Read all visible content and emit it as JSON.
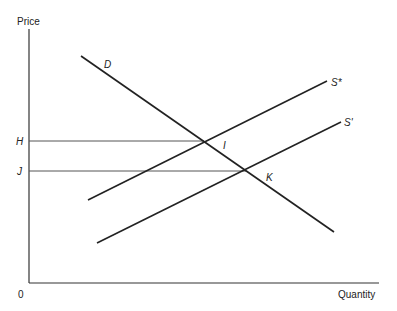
{
  "diagram": {
    "type": "supply-demand",
    "axes": {
      "y_label": "Price",
      "x_label": "Quantity",
      "origin_label": "0"
    },
    "price_levels": [
      {
        "label": "H",
        "y": 141
      },
      {
        "label": "J",
        "y": 171
      }
    ],
    "curves": [
      {
        "name": "D",
        "label": "D",
        "x1": 81,
        "y1": 56,
        "x2": 334,
        "y2": 232,
        "label_x": 104,
        "label_y": 68
      },
      {
        "name": "S*",
        "label": "S*",
        "x1": 88,
        "y1": 200,
        "x2": 327,
        "y2": 81,
        "label_x": 331,
        "label_y": 86
      },
      {
        "name": "S'",
        "label": "S'",
        "x1": 97,
        "y1": 243,
        "x2": 341,
        "y2": 122,
        "label_x": 344,
        "label_y": 126
      }
    ],
    "points": [
      {
        "label": "I",
        "x": 204,
        "y": 141,
        "label_x": 223,
        "label_y": 149
      },
      {
        "label": "K",
        "x": 246,
        "y": 171,
        "label_x": 266,
        "label_y": 181
      }
    ],
    "colors": {
      "line": "#222222",
      "axis": "#333333",
      "background": "#ffffff"
    }
  }
}
